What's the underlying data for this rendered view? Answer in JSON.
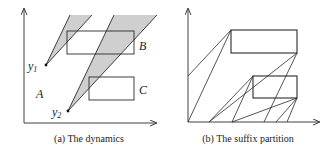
{
  "panels": [
    {
      "caption": "(a) The dynamics",
      "labels": {
        "A": "A",
        "B": "B",
        "C": "C",
        "y1_base": "y",
        "y1_sub": "1",
        "y2_base": "y",
        "y2_sub": "2"
      }
    },
    {
      "caption": "(b) The suffix partition"
    }
  ],
  "colors": {
    "stroke": "#2a2a2a",
    "shade": "#cfcfcf",
    "background": "#ffffff"
  }
}
